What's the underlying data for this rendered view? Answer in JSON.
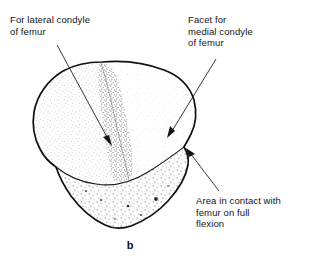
{
  "figure": {
    "caption": "b",
    "background_color": "#ffffff",
    "ink_color": "#141414",
    "stipple_color": "#9a9a9a"
  },
  "labels": {
    "lateral_condyle": {
      "name": "for-lateral-condyle-of-femur",
      "line1": "For lateral condyle",
      "line2": "of femur",
      "text": "For lateral condyle\nof femur"
    },
    "medial_condyle": {
      "name": "facet-for-medial-condyle-of-femur",
      "line1": "Facet for",
      "line2": "medial condyle",
      "line3": "of femur",
      "text": "Facet for\nmedial condyle\nof femur"
    },
    "contact_area": {
      "name": "area-in-contact-with-femur-on-full-flexion",
      "line1": "Area in contact with",
      "line2": "femur on full",
      "line3": "flexion",
      "text": "Area in contact with\nfemur on full\nflexion"
    }
  },
  "leaders": [
    {
      "name": "leader-lateral-condyle",
      "from_x": 57,
      "from_y": 45,
      "to_x": 112,
      "to_y": 146
    },
    {
      "name": "leader-medial-condyle",
      "from_x": 216,
      "from_y": 59,
      "to_x": 167,
      "to_y": 138
    },
    {
      "name": "leader-contact-area",
      "from_x": 219,
      "from_y": 191,
      "to_x": 186,
      "to_y": 148
    }
  ],
  "regions": [
    {
      "name": "lateral-facet",
      "description": "large stippled facet on the left"
    },
    {
      "name": "medial-facet",
      "description": "lighter facet on the right"
    },
    {
      "name": "vertical-ridge",
      "description": "dense stippled ridge dividing the facets"
    },
    {
      "name": "inferior-contact-band",
      "description": "coarsely stippled band at the lower margin"
    }
  ]
}
